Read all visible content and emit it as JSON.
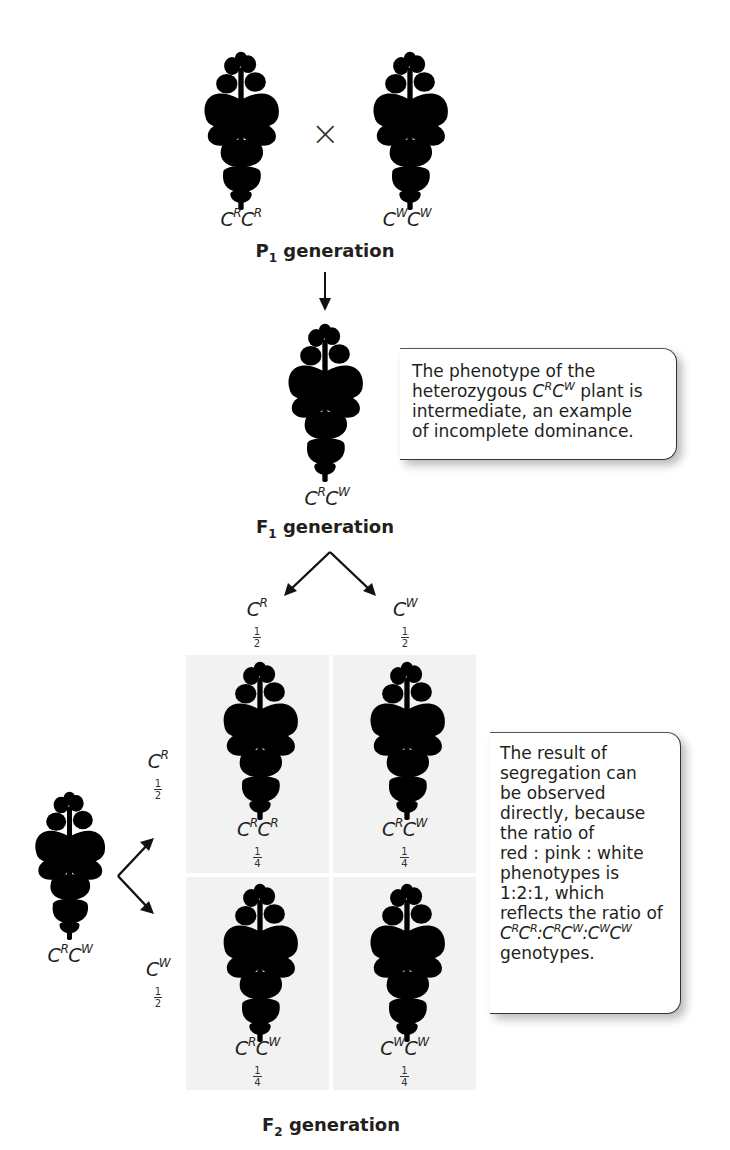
{
  "p1": {
    "left_plant": {
      "color": "red",
      "genotype_base": "C",
      "allele1": "R",
      "allele2": "R"
    },
    "cross_symbol": "×",
    "right_plant": {
      "color": "white",
      "genotype_base": "C",
      "allele1": "W",
      "allele2": "W"
    },
    "title_letter": "P",
    "title_sub": "1",
    "title_rest": " generation"
  },
  "f1": {
    "plant": {
      "color": "pink",
      "genotype_base": "C",
      "allele1": "R",
      "allele2": "W"
    },
    "title_letter": "F",
    "title_sub": "1",
    "title_rest": " generation",
    "callout": {
      "line1": "The phenotype of the",
      "line2_pre": "heterozygous ",
      "line2_geno_a": "R",
      "line2_geno_b": "W",
      "line2_post": " plant is",
      "line3": "intermediate, an example",
      "line4": "of incomplete dominance."
    }
  },
  "gametes_top": [
    {
      "allele": "R",
      "fraction_num": "1",
      "fraction_den": "2"
    },
    {
      "allele": "W",
      "fraction_num": "1",
      "fraction_den": "2"
    }
  ],
  "gametes_left": [
    {
      "allele": "R",
      "fraction_num": "1",
      "fraction_den": "2"
    },
    {
      "allele": "W",
      "fraction_num": "1",
      "fraction_den": "2"
    }
  ],
  "left_parent": {
    "color": "pink",
    "genotype_base": "C",
    "allele1": "R",
    "allele2": "W"
  },
  "punnett": [
    {
      "color": "red",
      "a1": "R",
      "a2": "R",
      "fraction_num": "1",
      "fraction_den": "4"
    },
    {
      "color": "pink",
      "a1": "R",
      "a2": "W",
      "fraction_num": "1",
      "fraction_den": "4"
    },
    {
      "color": "pink",
      "a1": "R",
      "a2": "W",
      "fraction_num": "1",
      "fraction_den": "4"
    },
    {
      "color": "white",
      "a1": "W",
      "a2": "W",
      "fraction_num": "1",
      "fraction_den": "4"
    }
  ],
  "f2": {
    "title_letter": "F",
    "title_sub": "2",
    "title_rest": " generation",
    "callout": {
      "line1": "The result of",
      "line2": "segregation can",
      "line3": "be observed",
      "line4": "directly, because",
      "line5": "the ratio of",
      "line6": "red : pink : white",
      "line7": "phenotypes is",
      "line8": "1:2:1, which",
      "line9": "reflects the ratio of",
      "line10_ratio": [
        [
          "R",
          "R"
        ],
        [
          "R",
          "W"
        ],
        [
          "W",
          "W"
        ]
      ],
      "line11": "genotypes."
    }
  },
  "colors": {
    "red_dark": "#3a3a3a",
    "red_mid": "#5a5a5a",
    "pink_mid": "#a9a9a9",
    "white_fill": "#ececec",
    "white_edge": "#9a9a9a",
    "cell_bg": "#f2f2f2",
    "stem": "#8c8c8c"
  }
}
